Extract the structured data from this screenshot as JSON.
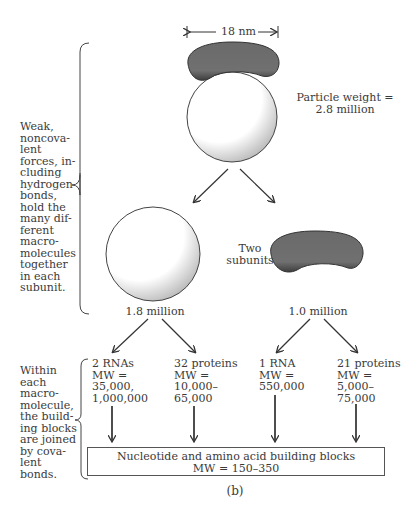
{
  "scale": {
    "label": "18 nm"
  },
  "ribosome": {
    "particle_weight_label": "Particle weight =",
    "particle_weight_value": "2.8 million"
  },
  "subunits": {
    "label_line1": "Two",
    "label_line2": "subunits",
    "large": {
      "weight": "1.8 million"
    },
    "small": {
      "weight": "1.0 million"
    }
  },
  "annotations": {
    "noncovalent": [
      "Weak,",
      "noncova-",
      "lent",
      "forces, in-",
      "cluding",
      "hydrogen",
      "bonds,",
      "hold the",
      "many dif-",
      "ferent",
      "macro-",
      "molecules",
      "together",
      "in each",
      "subunit."
    ],
    "covalent": [
      "Within",
      "each",
      "macro-",
      "molecule,",
      "the build-",
      "ing blocks",
      "are joined",
      "by cova-",
      "lent",
      "bonds."
    ]
  },
  "components": [
    {
      "lines": [
        "2 RNAs",
        "MW =",
        "35,000,",
        "1,000,000"
      ]
    },
    {
      "lines": [
        "32 proteins",
        "MW =",
        "10,000–",
        "65,000"
      ]
    },
    {
      "lines": [
        "1 RNA",
        "MW =",
        "550,000"
      ]
    },
    {
      "lines": [
        "21 proteins",
        "MW =",
        "5,000–",
        "75,000"
      ]
    }
  ],
  "building_blocks": {
    "line1": "Nucleotide and amino acid building blocks",
    "line2": "MW = 150–350"
  },
  "caption": "(b)",
  "colors": {
    "subunit_fill": "#6e6e6e",
    "stroke": "#444444",
    "stipple": "#555555"
  }
}
